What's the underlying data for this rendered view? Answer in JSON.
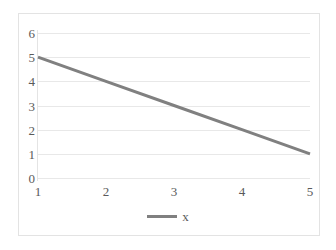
{
  "chart_data": {
    "type": "line",
    "title": "",
    "subtitle": "",
    "xlabel": "",
    "ylabel": "",
    "x": [
      1,
      2,
      3,
      4,
      5
    ],
    "categories": [
      "1",
      "2",
      "3",
      "4",
      "5"
    ],
    "series": [
      {
        "name": "x",
        "values": [
          5,
          4,
          3,
          2,
          1
        ],
        "color": "#808080",
        "line_width": 3
      }
    ],
    "y_ticks": [
      0,
      1,
      2,
      3,
      4,
      5,
      6
    ],
    "y_tick_labels": [
      "0",
      "1",
      "2",
      "3",
      "4",
      "5",
      "6"
    ],
    "x_tick_labels": [
      "1",
      "2",
      "3",
      "4",
      "5"
    ],
    "ylim": [
      0,
      6
    ],
    "xlim": [
      1,
      5
    ],
    "grid": {
      "horizontal": true,
      "vertical": false,
      "color": "#e8e8e8"
    },
    "legend": {
      "position": "bottom",
      "entries": [
        {
          "label": "x",
          "color": "#808080"
        }
      ]
    },
    "frame": {
      "border_color": "#e3e3e3",
      "background": "#ffffff"
    },
    "axis_label_color": "#5a5a5a"
  }
}
